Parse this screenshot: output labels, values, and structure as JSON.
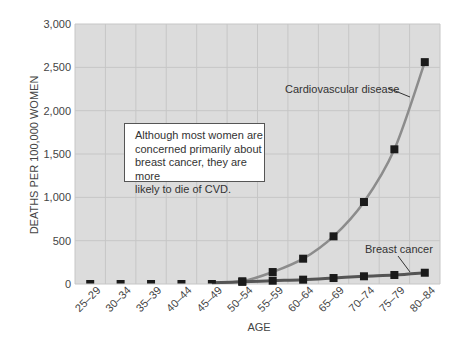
{
  "chart_data": {
    "type": "line",
    "title": "",
    "xlabel": "AGE",
    "ylabel": "DEATHS PER 100,000 WOMEN",
    "ylim": [
      0,
      3000
    ],
    "yticks": [
      0,
      500,
      1000,
      1500,
      2000,
      2500,
      3000
    ],
    "ytick_labels": [
      "0",
      "500",
      "1,000",
      "1,500",
      "2,000",
      "2,500",
      "3,000"
    ],
    "grid": true,
    "legend": "none (direct labels)",
    "categories": [
      "25–29",
      "30–34",
      "35–39",
      "40–44",
      "45–49",
      "50–54",
      "55–59",
      "60–64",
      "65–69",
      "70–74",
      "75–79",
      "80–84"
    ],
    "series": [
      {
        "name": "Cardiovascular disease",
        "color": "#8c8c8c",
        "values": [
          2,
          3,
          5,
          10,
          15,
          31,
          138,
          292,
          550,
          946,
          1554,
          2560
        ]
      },
      {
        "name": "Breast cancer",
        "color": "#555555",
        "values": [
          1,
          3,
          5,
          10,
          15,
          25,
          38,
          50,
          69,
          89,
          104,
          130
        ]
      }
    ],
    "annotations": [
      {
        "text": "Although most women are concerned primarily about breast cancer, they are more likely to die of CVD."
      }
    ]
  },
  "annotation": {
    "lines": [
      "Although most women are",
      "concerned primarily about",
      "breast cancer, they are more",
      "likely to die of CVD."
    ]
  },
  "labels": {
    "cvd": "Cardiovascular disease",
    "breast": "Breast cancer"
  },
  "colors": {
    "plot_bg": "#dcdcdc",
    "grid": "#c6c6c6",
    "marker": "#1a1a1a"
  }
}
